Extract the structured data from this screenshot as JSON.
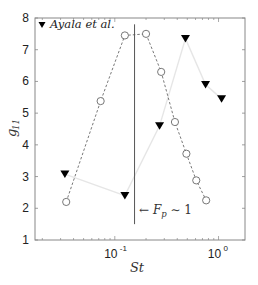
{
  "chart_data": {
    "type": "line",
    "title": "",
    "xlabel": "St",
    "ylabel": "g11",
    "xscale": "log",
    "xlim": [
      0.017,
      1.8
    ],
    "ylim": [
      1,
      8
    ],
    "yticks": [
      1,
      2,
      3,
      4,
      5,
      6,
      7,
      8
    ],
    "xticks": [
      {
        "value": 0.1,
        "label": "10",
        "exp": "-1"
      },
      {
        "value": 1,
        "label": "10",
        "exp": "0"
      }
    ],
    "grid": false,
    "legend": {
      "position": "upper left",
      "entries": [
        {
          "label": "Ayala et al.",
          "marker": "filled-down-triangle"
        }
      ]
    },
    "series": [
      {
        "name": "present data",
        "marker": "open-circle",
        "line": "dashed",
        "color": "#555555",
        "x": [
          0.034,
          0.073,
          0.125,
          0.2,
          0.28,
          0.38,
          0.49,
          0.61,
          0.76
        ],
        "y": [
          2.2,
          5.38,
          7.45,
          7.5,
          6.3,
          4.72,
          3.72,
          2.88,
          2.25
        ]
      },
      {
        "name": "Ayala et al.",
        "marker": "filled-down-triangle",
        "line": "solid-light",
        "color": "#000000",
        "line_color": "#e6e6e6",
        "x": [
          0.033,
          0.125,
          0.27,
          0.48,
          0.75,
          1.07
        ],
        "y": [
          3.08,
          2.4,
          4.6,
          7.35,
          5.9,
          5.45
        ]
      }
    ],
    "annotations": [
      {
        "type": "vline",
        "x": 0.155,
        "y_from": 1.5,
        "y_to": 7.8,
        "color": "#555555"
      },
      {
        "type": "text",
        "text": "← F_p ∼ 1",
        "x": 0.175,
        "y": 2.0
      }
    ]
  },
  "labels": {
    "xlabel": "St",
    "ylabel_main": "g",
    "ylabel_sub": "11",
    "legend": "Ayala et al.",
    "annot_arrow": "← ",
    "annot_F": "F",
    "annot_sub": "p",
    "annot_rest": " ∼ 1"
  }
}
